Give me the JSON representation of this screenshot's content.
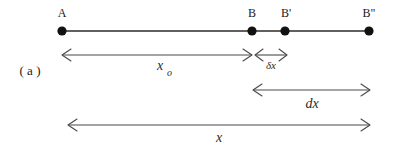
{
  "figure": {
    "panel_label": "( a )",
    "background_color": "#ffffff",
    "line_color": "#2b2b2b",
    "dot_color": "#111111",
    "dimension_color": "#4a4a4a"
  },
  "points": [
    {
      "id": "A",
      "label": "A",
      "x": 62
    },
    {
      "id": "B",
      "label": "B",
      "x": 252
    },
    {
      "id": "Bp",
      "label": "B'",
      "x": 285
    },
    {
      "id": "Bpp",
      "label": "B\"",
      "x": 369
    }
  ],
  "axis": {
    "y": 31,
    "x_start": 62,
    "x_end": 369
  },
  "dimensions": [
    {
      "id": "x0",
      "label": "x",
      "subscript": "o",
      "from": 62,
      "to": 252,
      "y": 55,
      "label_x": 160,
      "label_y": 70
    },
    {
      "id": "deltax",
      "label": "δx",
      "subscript": "",
      "from": 255,
      "to": 287,
      "y": 55,
      "label_x": 271,
      "label_y": 70
    },
    {
      "id": "dx",
      "label": "dx",
      "subscript": "",
      "from": 253,
      "to": 370,
      "y": 90,
      "label_x": 312,
      "label_y": 108
    },
    {
      "id": "x",
      "label": "x",
      "subscript": "",
      "from": 68,
      "to": 370,
      "y": 125,
      "label_x": 219,
      "label_y": 142
    }
  ],
  "panel": {
    "label_x": 30,
    "label_y": 74
  }
}
